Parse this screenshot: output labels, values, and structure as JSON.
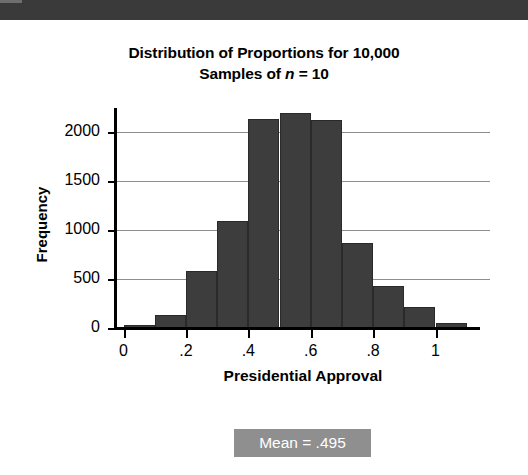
{
  "chart_data": {
    "type": "bar",
    "title": "Distribution of Proportions for 10,000 Samples of n = 10",
    "title_line1": "Distribution of Proportions for 10,000",
    "title_line2_prefix": "Samples of ",
    "title_line2_italic": "n",
    "title_line2_suffix": " = 10",
    "xlabel": "Presidential Approval",
    "ylabel": "Frequency",
    "categories": [
      "0.0",
      "0.1",
      "0.2",
      "0.3",
      "0.4",
      "0.5",
      "0.6",
      "0.7",
      "0.8",
      "0.9",
      "1.0"
    ],
    "values": [
      30,
      130,
      585,
      1090,
      2130,
      2190,
      2120,
      870,
      430,
      215,
      50
    ],
    "bin_width": 0.1,
    "xlim": [
      -0.05,
      1.1
    ],
    "ylim": [
      0,
      2300
    ],
    "x_ticks": [
      "0",
      ".2",
      ".4",
      ".6",
      ".8",
      "1"
    ],
    "x_tick_values": [
      0,
      0.2,
      0.4,
      0.6,
      0.8,
      1.0
    ],
    "y_ticks": [
      "0",
      "500",
      "1000",
      "1500",
      "2000"
    ],
    "y_tick_values": [
      0,
      500,
      1000,
      1500,
      2000
    ],
    "grid": true,
    "grid_axis": "y",
    "legend": false,
    "bar_color": "#3d3d3d",
    "grid_color": "#8e8e8e",
    "axis_color": "#000000",
    "background": "#ffffff"
  },
  "annotation": {
    "mean_label": "Mean = .495",
    "mean_value": 0.495,
    "box_color": "#8f8f8f",
    "text_color": "#ffffff"
  },
  "artifact": {
    "scan_band_color": "#3a3a3a"
  }
}
